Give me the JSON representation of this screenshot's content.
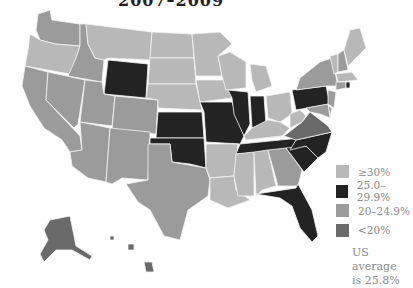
{
  "title_fragment": "2007–2009",
  "colors": {
    "ge30": "#b8b8b8",
    "r25_29": "#232323",
    "r20_24": "#9b9b9b",
    "lt20": "#6a6a6a"
  },
  "legend": [
    {
      "key": "ge30",
      "label": "≥30%"
    },
    {
      "key": "r25_29",
      "label": "25.0–29.9%"
    },
    {
      "key": "r20_24",
      "label": "20–24.9%"
    },
    {
      "key": "lt20",
      "label": "<20%"
    }
  ],
  "note": {
    "line1": "US average",
    "line2": "is 25.8%"
  },
  "states": {
    "WA": "r20_24",
    "OR": "ge30",
    "CA": "r20_24",
    "NV": "r20_24",
    "ID": "r20_24",
    "MT": "ge30",
    "WY": "r25_29",
    "UT": "r20_24",
    "AZ": "r20_24",
    "CO": "r20_24",
    "NM": "r20_24",
    "ND": "ge30",
    "SD": "ge30",
    "NE": "ge30",
    "KS": "r25_29",
    "OK": "r25_29",
    "TX": "r20_24",
    "MN": "ge30",
    "IA": "ge30",
    "MO": "r25_29",
    "AR": "ge30",
    "LA": "ge30",
    "WI": "ge30",
    "IL": "r25_29",
    "MI": "ge30",
    "IN": "r25_29",
    "OH": "ge30",
    "KY": "ge30",
    "TN": "r25_29",
    "MS": "ge30",
    "AL": "ge30",
    "GA": "r20_24",
    "FL": "r25_29",
    "SC": "r25_29",
    "NC": "r25_29",
    "VA": "lt20",
    "WV": "ge30",
    "PA": "r25_29",
    "NY": "r20_24",
    "VT": "ge30",
    "NH": "r20_24",
    "ME": "ge30",
    "MA": "ge30",
    "RI": "r25_29",
    "CT": "r20_24",
    "NJ": "r20_24",
    "DE": "r20_24",
    "MD": "r20_24",
    "AK": "lt20",
    "HI": "lt20"
  }
}
